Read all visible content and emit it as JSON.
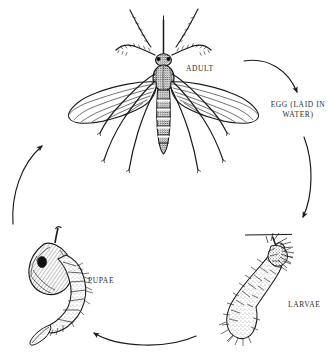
{
  "diagram": {
    "background_color": "#ffffff",
    "ink_color": "#1a1a1a",
    "label_color": "#2b2b2b",
    "stages": [
      {
        "id": "adult",
        "label": "ADULT"
      },
      {
        "id": "egg",
        "label": "EGG (LAID IN\nWATER)"
      },
      {
        "id": "larvae",
        "label": "LARVAE"
      },
      {
        "id": "pupae",
        "label": "PUPAE"
      }
    ],
    "arrows": [
      {
        "id": "adult-to-egg",
        "direction": "clockwise",
        "from": "adult",
        "to": "egg"
      },
      {
        "id": "egg-to-larvae",
        "direction": "clockwise",
        "from": "egg",
        "to": "larvae"
      },
      {
        "id": "larvae-to-pupae",
        "direction": "clockwise",
        "from": "larvae",
        "to": "pupae"
      },
      {
        "id": "pupae-to-adult",
        "direction": "clockwise",
        "from": "pupae",
        "to": "adult"
      }
    ],
    "illustrations": [
      {
        "id": "adult-mosquito",
        "name": "adult-mosquito-illustration"
      },
      {
        "id": "larva",
        "name": "larva-illustration"
      },
      {
        "id": "pupa",
        "name": "pupa-illustration"
      },
      {
        "id": "waterline",
        "name": "water-surface-line"
      }
    ]
  }
}
